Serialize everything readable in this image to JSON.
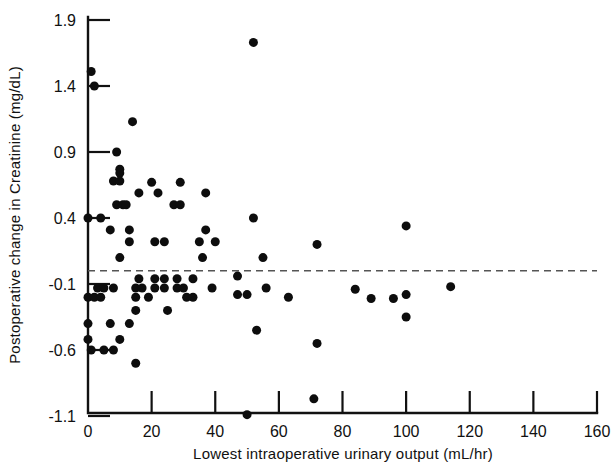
{
  "chart_data": {
    "type": "scatter",
    "title": "",
    "xlabel": "Lowest intraoperative urinary output  (mL/hr)",
    "ylabel": "Postoperative change in Creatinine (mg/dL)",
    "xlim": [
      0,
      160
    ],
    "ylim": [
      -1.1,
      1.9
    ],
    "xticks": [
      0,
      20,
      40,
      60,
      80,
      100,
      120,
      140,
      160
    ],
    "xtick_labels": [
      "0",
      "20",
      "40",
      "60",
      "80",
      "100",
      "120",
      "140",
      "160"
    ],
    "yticks": [
      -1.1,
      -0.6,
      -0.1,
      0.4,
      0.9,
      1.4,
      1.9
    ],
    "ytick_labels": [
      "-1.1",
      "-0.6",
      "-0.1",
      "0.4",
      "0.9",
      "1.4",
      "1.9"
    ],
    "grid": false,
    "legend": null,
    "marker": "filled-circle",
    "marker_color": "#0d0d0d",
    "marker_size_px": 9,
    "reference_lines": [
      {
        "name": "zero-change-line",
        "orientation": "horizontal",
        "y": 0.0,
        "style": "dashed",
        "color": "#555555",
        "x_start": 0,
        "x_end": 160
      }
    ],
    "points": [
      [
        1,
        1.51
      ],
      [
        2,
        1.4
      ],
      [
        14,
        1.13
      ],
      [
        9,
        0.9
      ],
      [
        10,
        0.77
      ],
      [
        10,
        0.74
      ],
      [
        8,
        0.68
      ],
      [
        10,
        0.68
      ],
      [
        20,
        0.67
      ],
      [
        29,
        0.67
      ],
      [
        16,
        0.59
      ],
      [
        22,
        0.59
      ],
      [
        37,
        0.59
      ],
      [
        9,
        0.5
      ],
      [
        11,
        0.5
      ],
      [
        12,
        0.5
      ],
      [
        27,
        0.5
      ],
      [
        29,
        0.5
      ],
      [
        0,
        0.4
      ],
      [
        4,
        0.4
      ],
      [
        7,
        0.31
      ],
      [
        13,
        0.31
      ],
      [
        37,
        0.31
      ],
      [
        52,
        0.4
      ],
      [
        100,
        0.34
      ],
      [
        13,
        0.22
      ],
      [
        21,
        0.22
      ],
      [
        24,
        0.22
      ],
      [
        35,
        0.22
      ],
      [
        40,
        0.22
      ],
      [
        10,
        0.1
      ],
      [
        36,
        0.1
      ],
      [
        55,
        0.1
      ],
      [
        72,
        0.2
      ],
      [
        52,
        1.73
      ],
      [
        16,
        -0.06
      ],
      [
        21,
        -0.06
      ],
      [
        24,
        -0.06
      ],
      [
        28,
        -0.06
      ],
      [
        33,
        -0.06
      ],
      [
        47,
        -0.04
      ],
      [
        3,
        -0.13
      ],
      [
        5,
        -0.13
      ],
      [
        8,
        -0.13
      ],
      [
        15,
        -0.13
      ],
      [
        17,
        -0.13
      ],
      [
        21,
        -0.13
      ],
      [
        24,
        -0.13
      ],
      [
        28,
        -0.13
      ],
      [
        30,
        -0.13
      ],
      [
        39,
        -0.13
      ],
      [
        56,
        -0.13
      ],
      [
        0,
        -0.2
      ],
      [
        2,
        -0.2
      ],
      [
        4,
        -0.2
      ],
      [
        15,
        -0.2
      ],
      [
        19,
        -0.2
      ],
      [
        31,
        -0.2
      ],
      [
        33,
        -0.2
      ],
      [
        47,
        -0.18
      ],
      [
        50,
        -0.18
      ],
      [
        63,
        -0.2
      ],
      [
        15,
        -0.3
      ],
      [
        25,
        -0.3
      ],
      [
        84,
        -0.14
      ],
      [
        89,
        -0.21
      ],
      [
        96,
        -0.21
      ],
      [
        100,
        -0.18
      ],
      [
        100,
        -0.35
      ],
      [
        114,
        -0.12
      ],
      [
        0,
        -0.4
      ],
      [
        7,
        -0.4
      ],
      [
        13,
        -0.4
      ],
      [
        53,
        -0.45
      ],
      [
        0,
        -0.52
      ],
      [
        10,
        -0.52
      ],
      [
        72,
        -0.55
      ],
      [
        1,
        -0.6
      ],
      [
        5,
        -0.6
      ],
      [
        8,
        -0.6
      ],
      [
        15,
        -0.7
      ],
      [
        50,
        -1.09
      ],
      [
        71,
        -0.97
      ]
    ]
  },
  "axes": {
    "x_axis_name": "x-axis",
    "y_axis_name": "y-axis"
  }
}
